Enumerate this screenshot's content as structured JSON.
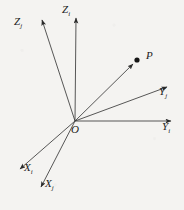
{
  "figure": {
    "background_color": "#f4f3f1",
    "line_color": "#2b2b2b",
    "label_color": "#1b1b1b"
  },
  "origin": {
    "label": "O",
    "x": 75,
    "y": 121
  },
  "point": {
    "label": "P",
    "x": 139,
    "y": 59,
    "marker": "filled-dot"
  },
  "axes": [
    {
      "id": "z-i",
      "label": "Z",
      "subscript": "i",
      "frame": "i",
      "tip_x": 76,
      "tip_y": 14,
      "label_x": 66,
      "label_y": 10
    },
    {
      "id": "z-j",
      "label": "Z",
      "subscript": "j",
      "frame": "j",
      "tip_x": 41,
      "tip_y": 16,
      "label_x": 18,
      "label_y": 22
    },
    {
      "id": "y-i",
      "label": "Y",
      "subscript": "i",
      "frame": "i",
      "tip_x": 175,
      "tip_y": 121,
      "label_x": 163,
      "label_y": 126
    },
    {
      "id": "y-j",
      "label": "Y",
      "subscript": "j",
      "frame": "j",
      "tip_x": 171,
      "tip_y": 84,
      "label_x": 160,
      "label_y": 91
    },
    {
      "id": "x-i",
      "label": "X",
      "subscript": "i",
      "frame": "i",
      "tip_x": 16,
      "tip_y": 172,
      "label_x": 25,
      "label_y": 167
    },
    {
      "id": "x-j",
      "label": "X",
      "subscript": "j",
      "frame": "j",
      "tip_x": 38,
      "tip_y": 190,
      "label_x": 45,
      "label_y": 183
    }
  ],
  "rays": [
    {
      "id": "ray-op",
      "from": "O",
      "to": "P",
      "has_arrow": true
    }
  ]
}
